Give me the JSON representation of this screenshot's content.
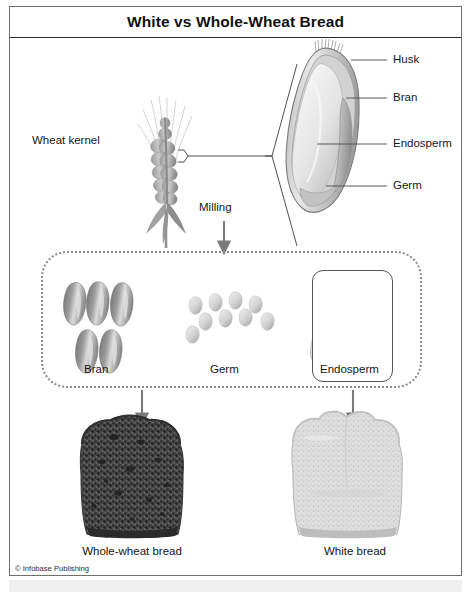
{
  "figure": {
    "title": "White vs Whole-Wheat Bread",
    "copyright": "© Infobase Publishing"
  },
  "diagram": {
    "source_label": "Wheat kernel",
    "process_label": "Milling",
    "kernel_parts": [
      {
        "name": "husk",
        "label": "Husk"
      },
      {
        "name": "bran",
        "label": "Bran"
      },
      {
        "name": "endosperm",
        "label": "Endosperm"
      },
      {
        "name": "germ",
        "label": "Germ"
      }
    ],
    "milled_components": [
      {
        "name": "bran",
        "label": "Bran",
        "count": 5,
        "boxed": false
      },
      {
        "name": "germ",
        "label": "Germ",
        "count": 9,
        "boxed": false
      },
      {
        "name": "endosperm",
        "label": "Endosperm",
        "count": 5,
        "boxed": true
      }
    ],
    "products": [
      {
        "name": "whole-wheat-bread",
        "label": "Whole-wheat bread"
      },
      {
        "name": "white-bread",
        "label": "White bread"
      }
    ]
  },
  "colors": {
    "frame_border": "#6f6f6f",
    "title_rule": "#2b2b2b",
    "dotted_border": "#8a8a8a",
    "leader_line": "#4a4a4a",
    "arrow": "#7a7a7a",
    "bran_dark": "#7d7d7d",
    "germ_light": "#d6d6d6",
    "endosperm_light": "#cfcfcf",
    "wholewheat_bread": "#555555",
    "white_bread": "#dcdcdc",
    "bottom_strip": "#efefef",
    "text": "#161616"
  }
}
